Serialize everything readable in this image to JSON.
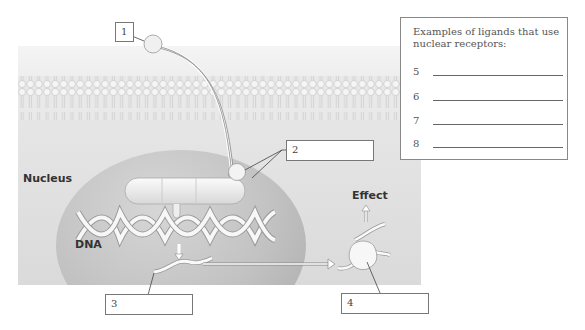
{
  "diagram": {
    "labels": {
      "nucleus": "Nucleus",
      "dna": "DNA",
      "effect": "Effect"
    },
    "callouts": [
      {
        "id": "1",
        "text": "1"
      },
      {
        "id": "2",
        "text": "2"
      },
      {
        "id": "3",
        "text": "3"
      },
      {
        "id": "4",
        "text": "4"
      }
    ],
    "ligand_box": {
      "title": "Examples of ligands that use nuclear receptors:",
      "items": [
        {
          "number": "5",
          "answer": ""
        },
        {
          "number": "6",
          "answer": ""
        },
        {
          "number": "7",
          "answer": ""
        },
        {
          "number": "8",
          "answer": ""
        }
      ]
    },
    "colors": {
      "panel": "#e0e0e0",
      "nucleus": "#c0c0c0",
      "outline": "#777777",
      "text": "#333333"
    }
  }
}
